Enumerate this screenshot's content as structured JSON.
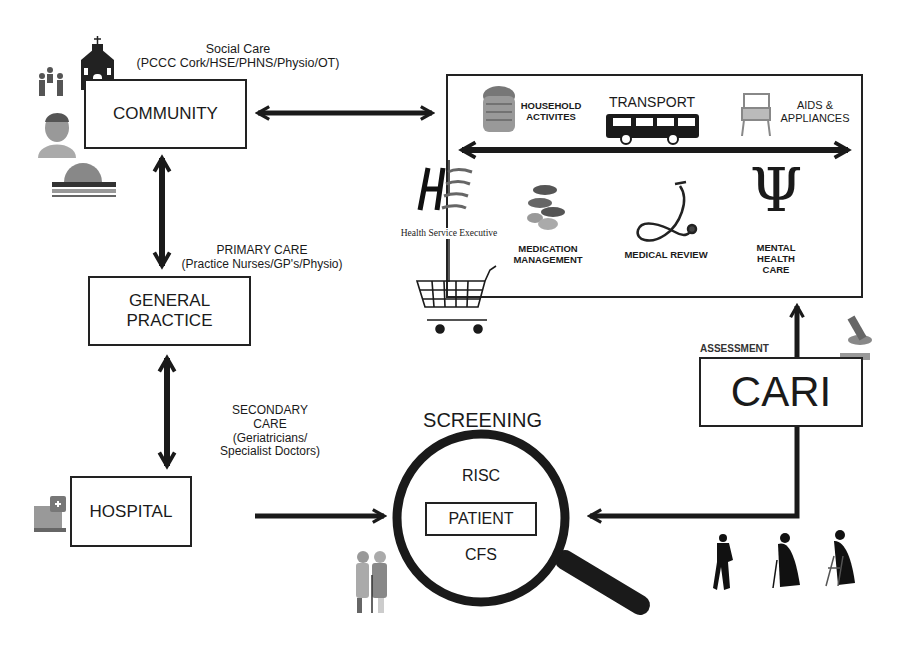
{
  "community": {
    "label": "COMMUNITY",
    "caption_title": "Social Care",
    "caption_detail": "(PCCC Cork/HSE/PHNS/Physio/OT)"
  },
  "general_practice": {
    "label_line1": "GENERAL",
    "label_line2": "PRACTICE",
    "caption_title": "PRIMARY CARE",
    "caption_detail": "(Practice Nurses/GP's/Physio)"
  },
  "hospital": {
    "label": "HOSPITAL",
    "caption_line1": "SECONDARY",
    "caption_line2": "CARE",
    "caption_line3": "(Geriatricians/",
    "caption_line4": "Specialist Doctors)"
  },
  "screening": {
    "title": "SCREENING",
    "top_tool": "RISC",
    "center": "PATIENT",
    "bottom_tool": "CFS"
  },
  "cari": {
    "label": "CARI",
    "caption": "ASSESSMENT"
  },
  "services": {
    "household": {
      "line1": "HOUSEHOLD",
      "line2": "ACTIVITES"
    },
    "transport": "TRANSPORT",
    "aids": {
      "line1": "AIDS &",
      "line2": "APPLIANCES"
    },
    "medication": {
      "line1": "MEDICATION",
      "line2": "MANAGEMENT"
    },
    "medical_review": "MEDICAL REVIEW",
    "mental_health": {
      "line1": "MENTAL",
      "line2": "HEALTH",
      "line3": "CARE"
    },
    "psi_symbol": "Ψ"
  },
  "hse": {
    "logo_text": "HSE",
    "name": "Health Service Executive"
  }
}
